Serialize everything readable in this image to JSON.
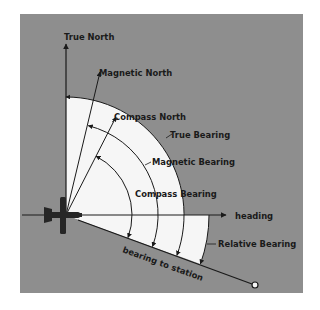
{
  "figure": {
    "background_color": "#8e8e8e",
    "wedge_color": "#ffffff",
    "ink_color": "#1a1a1a",
    "origin": {
      "x": 66,
      "y": 215
    },
    "labels": {
      "true_north": "True North",
      "magnetic_north": "Magnetic North",
      "compass_north": "Compass North",
      "true_bearing": "True Bearing",
      "magnetic_bearing": "Magnetic Bearing",
      "compass_bearing": "Compass Bearing",
      "heading": "heading",
      "relative_bearing": "Relative Bearing",
      "bearing_to_station": "bearing to station"
    },
    "reference_lines": [
      {
        "name": "True North",
        "angle_deg": 0
      },
      {
        "name": "Magnetic North",
        "angle_deg": 14
      },
      {
        "name": "Compass North",
        "angle_deg": 27
      },
      {
        "name": "heading",
        "angle_deg": 90
      },
      {
        "name": "bearing to station",
        "angle_deg": 110
      }
    ],
    "arcs": [
      {
        "name": "True Bearing",
        "from": "True North",
        "to": "bearing to station",
        "radius": 118
      },
      {
        "name": "Magnetic Bearing",
        "from": "Magnetic North",
        "to": "bearing to station",
        "radius": 92
      },
      {
        "name": "Compass Bearing",
        "from": "Compass North",
        "to": "bearing to station",
        "radius": 66
      },
      {
        "name": "Relative Bearing",
        "from": "heading",
        "to": "bearing to station",
        "radius": 143
      }
    ]
  }
}
